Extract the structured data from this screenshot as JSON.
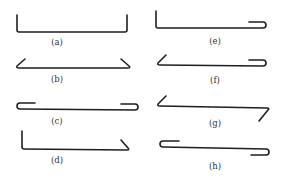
{
  "figure": {
    "stroke_color": "#1e1e1e",
    "label_color": "#333333",
    "items": [
      {
        "id": "a",
        "label": "(a)",
        "shape": "straight bar with 90-degree upturns at both ends"
      },
      {
        "id": "b",
        "label": "(b)",
        "shape": "straight bar with 135-degree inclined bends at both ends"
      },
      {
        "id": "c",
        "label": "(c)",
        "shape": "straight bar with 180-degree hooks at both ends"
      },
      {
        "id": "d",
        "label": "(d)",
        "shape": "90-degree upturn at left, inclined bend at right"
      },
      {
        "id": "e",
        "label": "(e)",
        "shape": "90-degree upturn at left, 180-degree hook at right"
      },
      {
        "id": "f",
        "label": "(f)",
        "shape": "inclined bend at left, 180-degree hook at right"
      },
      {
        "id": "g",
        "label": "(g)",
        "shape": "inclined bend up at left, inclined bend down at right"
      },
      {
        "id": "h",
        "label": "(h)",
        "shape": "180-degree hook up at left, 180-degree hook down at right"
      }
    ]
  }
}
